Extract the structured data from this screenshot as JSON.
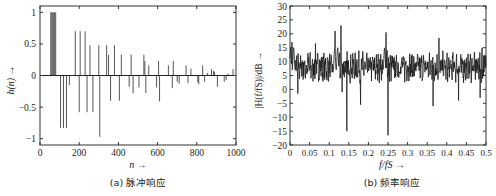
{
  "chart_data": [
    {
      "type": "bar",
      "subtype": "stem",
      "title": "",
      "caption": "(a) 脉冲响应",
      "xlabel": "n →",
      "ylabel": "h(n) →",
      "xlim": [
        0,
        1000
      ],
      "ylim": [
        -1.1,
        1.1
      ],
      "xticks": [
        0,
        200,
        400,
        600,
        800,
        1000
      ],
      "yticks": [
        -1,
        -0.5,
        0,
        0.5,
        1
      ],
      "grid": false,
      "stems": [
        {
          "n": 55,
          "v": 1.0
        },
        {
          "n": 60,
          "v": 1.0
        },
        {
          "n": 65,
          "v": 1.0
        },
        {
          "n": 70,
          "v": 1.0
        },
        {
          "n": 75,
          "v": 1.0
        },
        {
          "n": 80,
          "v": 1.0
        },
        {
          "n": 105,
          "v": -0.83
        },
        {
          "n": 120,
          "v": -0.83
        },
        {
          "n": 135,
          "v": -0.83
        },
        {
          "n": 150,
          "v": -0.15
        },
        {
          "n": 180,
          "v": 0.7
        },
        {
          "n": 200,
          "v": -0.58
        },
        {
          "n": 205,
          "v": 0.7
        },
        {
          "n": 230,
          "v": 0.7
        },
        {
          "n": 240,
          "v": -0.58
        },
        {
          "n": 255,
          "v": 0.48
        },
        {
          "n": 270,
          "v": -0.58
        },
        {
          "n": 300,
          "v": 0.48
        },
        {
          "n": 305,
          "v": -0.97
        },
        {
          "n": 340,
          "v": 0.48
        },
        {
          "n": 350,
          "v": 0.33
        },
        {
          "n": 360,
          "v": -0.4
        },
        {
          "n": 380,
          "v": 0.48
        },
        {
          "n": 405,
          "v": -0.4
        },
        {
          "n": 415,
          "v": 0.33
        },
        {
          "n": 455,
          "v": -0.18
        },
        {
          "n": 465,
          "v": 0.33
        },
        {
          "n": 475,
          "v": -0.28
        },
        {
          "n": 505,
          "v": -0.19
        },
        {
          "n": 530,
          "v": 0.33
        },
        {
          "n": 535,
          "v": 0.23
        },
        {
          "n": 540,
          "v": -0.28
        },
        {
          "n": 555,
          "v": 0.16
        },
        {
          "n": 595,
          "v": -0.19
        },
        {
          "n": 605,
          "v": 0.23
        },
        {
          "n": 610,
          "v": -0.41
        },
        {
          "n": 655,
          "v": 0.16
        },
        {
          "n": 675,
          "v": -0.2
        },
        {
          "n": 680,
          "v": 0.23
        },
        {
          "n": 700,
          "v": -0.1
        },
        {
          "n": 710,
          "v": -0.13
        },
        {
          "n": 745,
          "v": 0.16
        },
        {
          "n": 755,
          "v": -0.12
        },
        {
          "n": 770,
          "v": 0.11
        },
        {
          "n": 805,
          "v": -0.11
        },
        {
          "n": 810,
          "v": -0.14
        },
        {
          "n": 830,
          "v": 0.16
        },
        {
          "n": 840,
          "v": -0.1
        },
        {
          "n": 855,
          "v": 0.04
        },
        {
          "n": 875,
          "v": 0.1
        },
        {
          "n": 885,
          "v": 0.07
        },
        {
          "n": 890,
          "v": 0.06
        },
        {
          "n": 905,
          "v": -0.18
        },
        {
          "n": 940,
          "v": -0.1
        },
        {
          "n": 950,
          "v": -0.07
        },
        {
          "n": 960,
          "v": 0.03
        },
        {
          "n": 985,
          "v": 0.1
        }
      ]
    },
    {
      "type": "line",
      "title": "",
      "caption": "(b) 频率响应",
      "xlabel": "f/fS →",
      "ylabel": "|H(f/fS)|/dB →",
      "xlim": [
        0,
        0.5
      ],
      "ylim": [
        -20,
        30
      ],
      "xticks": [
        0,
        0.05,
        0.1,
        0.15,
        0.2,
        0.25,
        0.3,
        0.35,
        0.4,
        0.45,
        0.5
      ],
      "yticks": [
        -20,
        -15,
        -10,
        -5,
        0,
        5,
        10,
        15,
        20,
        25,
        30
      ],
      "grid": false,
      "baseline_db": 8,
      "notable_points": [
        {
          "x": 0.005,
          "y": 17
        },
        {
          "x": 0.02,
          "y": -1.5
        },
        {
          "x": 0.065,
          "y": 16.5
        },
        {
          "x": 0.115,
          "y": 21
        },
        {
          "x": 0.13,
          "y": 23
        },
        {
          "x": 0.133,
          "y": -1
        },
        {
          "x": 0.145,
          "y": -15
        },
        {
          "x": 0.18,
          "y": -5.5
        },
        {
          "x": 0.245,
          "y": 20.5
        },
        {
          "x": 0.25,
          "y": -16.5
        },
        {
          "x": 0.365,
          "y": -6
        },
        {
          "x": 0.38,
          "y": 18.5
        },
        {
          "x": 0.43,
          "y": -4
        },
        {
          "x": 0.485,
          "y": -3
        },
        {
          "x": 0.49,
          "y": 15
        }
      ]
    }
  ],
  "figure": {
    "panel_a_caption": "(a) 脉冲响应",
    "panel_b_caption": "(b) 频率响应",
    "line_color": "#1a1a1a",
    "stem_color": "#555555"
  }
}
